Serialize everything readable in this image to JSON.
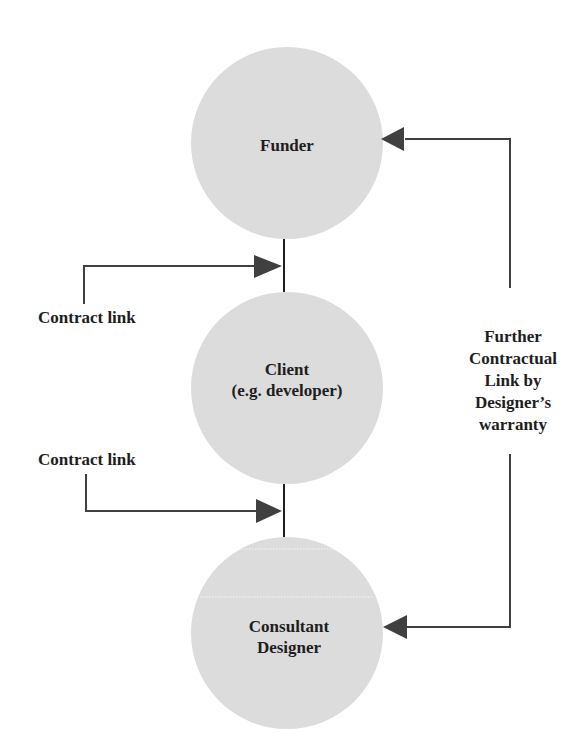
{
  "diagram": {
    "type": "contractual relationship flow",
    "colors": {
      "node_fill": "#dcdcdc",
      "line": "#404040",
      "arrow": "#404040",
      "text": "#1e1e1e",
      "background": "#ffffff"
    },
    "nodes": [
      {
        "id": "funder",
        "label": "Funder"
      },
      {
        "id": "client",
        "line1": "Client",
        "line2": "(e.g. developer)"
      },
      {
        "id": "consultant",
        "line1": "Consultant",
        "line2": "Designer"
      }
    ],
    "edges": [
      {
        "from": "funder",
        "to": "client",
        "label": "Contract link"
      },
      {
        "from": "client",
        "to": "consultant",
        "label": "Contract link"
      },
      {
        "from": "consultant",
        "to": "funder",
        "label": "Further Contractual Link by Designer's warranty",
        "bidirectional_arrows": true
      }
    ],
    "labels": {
      "contract_link_1": "Contract link",
      "contract_link_2": "Contract link",
      "further_link": {
        "line1": "Further",
        "line2": "Contractual",
        "line3": "Link by",
        "line4": "Designer’s",
        "line5": "warranty"
      }
    }
  }
}
